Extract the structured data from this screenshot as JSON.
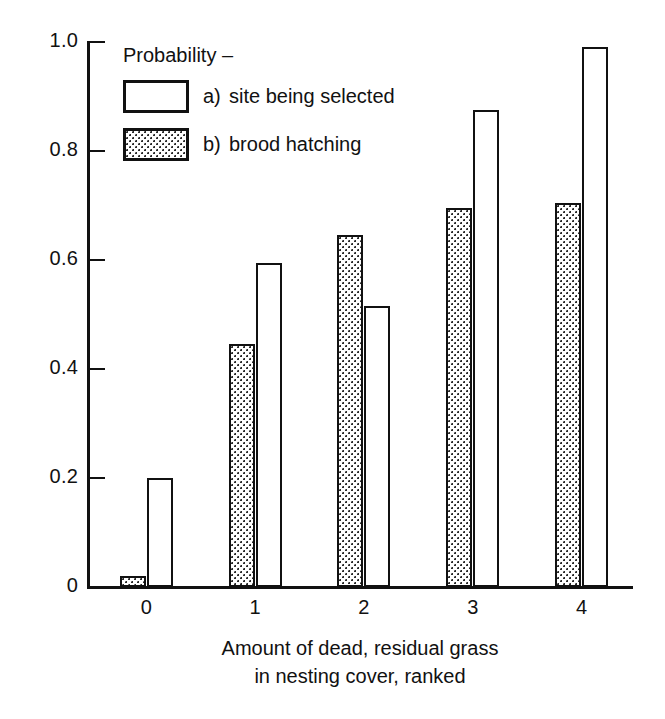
{
  "chart_data": {
    "type": "bar",
    "title": "",
    "xlabel": "Amount of dead, residual grass in nesting cover, ranked",
    "xlabel_line1": "Amount of dead, residual grass",
    "xlabel_line2": "in nesting cover, ranked",
    "ylabel": "Probability",
    "categories": [
      "0",
      "1",
      "2",
      "3",
      "4"
    ],
    "ylim": [
      0,
      1.0
    ],
    "yticks": [
      "0",
      "0.2",
      "0.4",
      "0.6",
      "0.8",
      "1.0"
    ],
    "ytick_values": [
      0,
      0.2,
      0.4,
      0.6,
      0.8,
      1.0
    ],
    "grid": false,
    "legend_position": "upper-left inside plot",
    "legend_title": "Probability –",
    "series": [
      {
        "name": "b)  brood hatching",
        "key": "b)",
        "label": "brood hatching",
        "fill": "stippled",
        "order_in_group": 1,
        "values": [
          0.02,
          0.445,
          0.645,
          0.695,
          0.705
        ]
      },
      {
        "name": "a)  site being selected",
        "key": "a)",
        "label": "site being selected",
        "fill": "white",
        "order_in_group": 2,
        "values": [
          0.2,
          0.595,
          0.515,
          0.875,
          0.99
        ]
      }
    ],
    "colors": {
      "ink": "#111111",
      "background": "#ffffff",
      "stipple": "#2b2b2b"
    }
  },
  "legend": {
    "title": "Probability –",
    "entries": [
      {
        "marker": "a)",
        "label": "site being selected",
        "swatch": "white-box"
      },
      {
        "marker": "b)",
        "label": "brood hatching",
        "swatch": "stippled-box"
      }
    ]
  },
  "axes": {
    "y": {
      "ticks": [
        "0",
        "0.2",
        "0.4",
        "0.6",
        "0.8",
        "1.0"
      ]
    },
    "x": {
      "ticks": [
        "0",
        "1",
        "2",
        "3",
        "4"
      ],
      "caption_line1": "Amount of dead, residual grass",
      "caption_line2": "in nesting cover, ranked"
    }
  }
}
